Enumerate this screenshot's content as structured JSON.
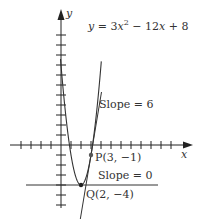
{
  "figure": {
    "equation": "y = 3x² − 12x + 8",
    "axes": {
      "x_label": "x",
      "y_label": "y"
    },
    "origin_px": [
      61,
      145
    ],
    "unit_px": 10,
    "x_ticks": [
      -12,
      -11,
      -10,
      -9,
      -8,
      -7,
      -6,
      -5,
      -4,
      -3,
      -2,
      -1,
      1,
      2,
      3,
      4,
      5,
      6,
      7,
      8,
      9,
      10,
      11,
      12
    ],
    "y_ticks": [
      -6,
      -5,
      -4,
      -3,
      -2,
      -1,
      1,
      2,
      3,
      4,
      5,
      6,
      7,
      8,
      9,
      10,
      11
    ],
    "points": [
      {
        "name": "P",
        "label": "P(3, −1)",
        "x": 3,
        "y": -1
      },
      {
        "name": "Q",
        "label": "Q(2, −4)",
        "x": 2,
        "y": -4
      }
    ],
    "tangents": [
      {
        "at": "P",
        "slope": 6,
        "label": "Slope = 6"
      },
      {
        "at": "Q",
        "slope": 0,
        "label": "Slope = 0"
      }
    ]
  },
  "labels": {
    "equation": "y = 3x² − 12x + 8",
    "slope6": "Slope = 6",
    "slope0": "Slope = 0",
    "p_label": "P(3, −1)",
    "q_label": "Q(2, −4)",
    "x_axis": "x",
    "y_axis": "y"
  }
}
